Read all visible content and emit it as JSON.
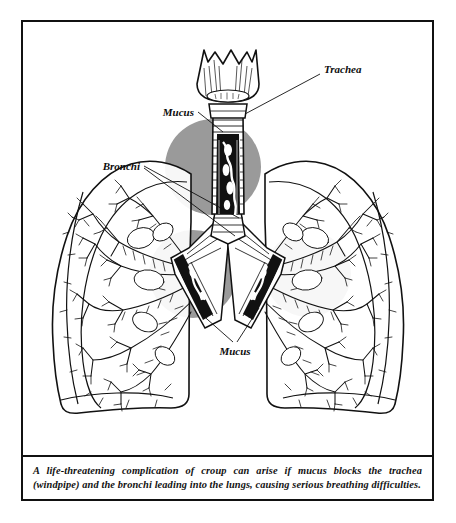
{
  "figure": {
    "caption": "A life-threatening complication of croup can arise if mucus blocks the trachea (windpipe) and the bronchi leading into the lungs, causing serious breathing difficulties.",
    "colors": {
      "ink": "#111111",
      "paper": "#ffffff",
      "highlight_gray": "#9a9a9a",
      "mucus_dark": "#111111",
      "cartilage_shade": "#d8d8d8"
    },
    "labels": [
      {
        "id": "trachea",
        "text": "Trachea"
      },
      {
        "id": "mucus-upper",
        "text": "Mucus"
      },
      {
        "id": "bronchi",
        "text": "Bronchi"
      },
      {
        "id": "mucus-lower",
        "text": "Mucus"
      }
    ],
    "structures": [
      {
        "id": "larynx",
        "name": "Larynx"
      },
      {
        "id": "trachea-tube",
        "name": "Trachea with cartilage rings"
      },
      {
        "id": "trachea-mucus-plug",
        "name": "Mucus plug in trachea"
      },
      {
        "id": "left-main-bronchus",
        "name": "Left main bronchus"
      },
      {
        "id": "right-main-bronchus",
        "name": "Right main bronchus"
      },
      {
        "id": "left-bronchus-mucus-plug",
        "name": "Mucus plug in left bronchus"
      },
      {
        "id": "right-bronchus-mucus-plug",
        "name": "Mucus plug in right bronchus"
      },
      {
        "id": "left-lung",
        "name": "Left lung"
      },
      {
        "id": "right-lung",
        "name": "Right lung"
      },
      {
        "id": "bronchial-tree-left",
        "name": "Left bronchial tree"
      },
      {
        "id": "bronchial-tree-right",
        "name": "Right bronchial tree"
      }
    ],
    "highlight_circles": [
      {
        "id": "highlight-trachea",
        "cx": 232,
        "cy": 167,
        "r": 48
      },
      {
        "id": "highlight-left-bronchus",
        "cx": 192,
        "cy": 272,
        "r": 44
      },
      {
        "id": "highlight-right-bronchus",
        "cx": 307,
        "cy": 272,
        "r": 43
      }
    ]
  }
}
